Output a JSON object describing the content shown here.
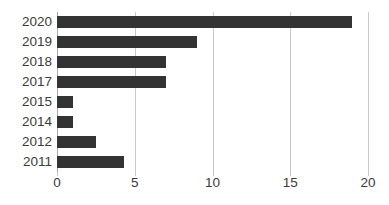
{
  "chart_data": {
    "type": "bar",
    "orientation": "horizontal",
    "title": "",
    "subtitle": "",
    "xlabel": "",
    "ylabel": "",
    "categories": [
      "2020",
      "2019",
      "2018",
      "2017",
      "2015",
      "2014",
      "2012",
      "2011"
    ],
    "values": [
      19,
      9,
      7,
      7,
      1,
      1,
      2.5,
      4.3
    ],
    "series": [
      {
        "name": "",
        "values": [
          19,
          9,
          7,
          7,
          1,
          1,
          2.5,
          4.3
        ]
      }
    ],
    "xlim": [
      0,
      20
    ],
    "xticks": [
      0,
      5,
      10,
      15,
      20
    ],
    "xtick_labels": [
      "0",
      "5",
      "10",
      "15",
      "20"
    ],
    "grid": "vertical",
    "legend": "none",
    "bar_color": "#333333",
    "gridline_color": "#c8c8c8",
    "axis_color": "#a6a6a6",
    "label_color": "#3a3a3a",
    "background_color": "#ffffff",
    "annotations": []
  }
}
